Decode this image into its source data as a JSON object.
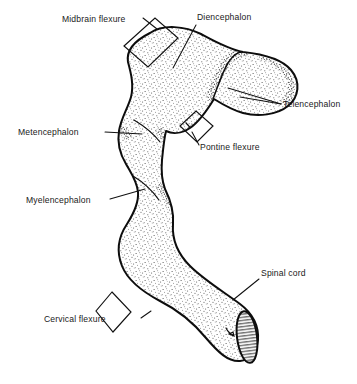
{
  "figure": {
    "background_color": "#ffffff",
    "ink_color": "#111111",
    "fill_style": "stipple",
    "width": 357,
    "height": 384
  },
  "labels": [
    {
      "id": "midbrain-flexure",
      "text": "Midbrain flexure",
      "x": 62,
      "y": 22,
      "anchor": "start",
      "kind": "flexure"
    },
    {
      "id": "diencephalon",
      "text": "Diencephalon",
      "x": 197,
      "y": 20,
      "anchor": "start",
      "kind": "vesicle"
    },
    {
      "id": "telencephalon",
      "text": "Telencephalon",
      "x": 283,
      "y": 107,
      "anchor": "start",
      "kind": "vesicle"
    },
    {
      "id": "metencephalon",
      "text": "Metencephalon",
      "x": 18,
      "y": 135,
      "anchor": "start",
      "kind": "vesicle"
    },
    {
      "id": "pontine-flexure",
      "text": "Pontine flexure",
      "x": 200,
      "y": 150,
      "anchor": "start",
      "kind": "flexure"
    },
    {
      "id": "myelencephalon",
      "text": "Myelencephalon",
      "x": 26,
      "y": 203,
      "anchor": "start",
      "kind": "vesicle"
    },
    {
      "id": "spinal-cord",
      "text": "Spinal cord",
      "x": 261,
      "y": 276,
      "anchor": "start",
      "kind": "structure"
    },
    {
      "id": "cervical-flexure",
      "text": "Cervical flexure",
      "x": 44,
      "y": 322,
      "anchor": "start",
      "kind": "flexure"
    }
  ],
  "leaders": [
    {
      "id": "leader-midbrain-flexure",
      "d": "M 143 18 L 155 28"
    },
    {
      "id": "leader-diencephalon",
      "d": "M 196 25 L 173 68"
    },
    {
      "id": "leader-telencephalon",
      "d": "M 281 104 L 228 88"
    },
    {
      "id": "leader-telencephalon-2",
      "d": "M 281 104 L 240 98"
    },
    {
      "id": "leader-metencephalon",
      "d": "M 105 132 L 142 134"
    },
    {
      "id": "leader-pontine-flexure",
      "d": "M 199 146 L 192 133"
    },
    {
      "id": "leader-myelencephalon",
      "d": "M 110 199 L 145 189"
    },
    {
      "id": "leader-spinal-cord",
      "d": "M 259 279 L 233 299"
    },
    {
      "id": "leader-cervical-flexure",
      "d": "M 141 318 L 150 312"
    }
  ],
  "brackets": [
    {
      "id": "bracket-midbrain-flexure",
      "points": "124,46 155,18 178,38 148,67",
      "note": "rotated square bracket over the dorsal midbrain bend"
    },
    {
      "id": "bracket-pontine-flexure",
      "points": "180,126 196,111 213,126 197,142",
      "note": "small rotated square bracket at the ventral pontine bend"
    },
    {
      "id": "bracket-cervical-flexure",
      "points": "112,292 131,312 113,332 96,311",
      "note": "rotated square bracket at the cervical bend"
    }
  ],
  "structures": [
    {
      "id": "neural-tube-outline",
      "name": "brain-and-spinal-cord-outline",
      "description": "continuous stippled silhouette of the embryonic brain curving from the diencephalon down through the metencephalon, myelencephalon and into the spinal cord"
    },
    {
      "id": "telencephalon-lobe",
      "name": "telencephalic-vesicle",
      "description": "rounded lateral lobe projecting to the upper right, separated from the diencephalon by a stippled sulcus"
    },
    {
      "id": "spinal-cord-cut-face",
      "name": "spinal-cord-cut-surface",
      "description": "elliptical cut end of the spinal cord rendered with horizontal hatching"
    }
  ]
}
